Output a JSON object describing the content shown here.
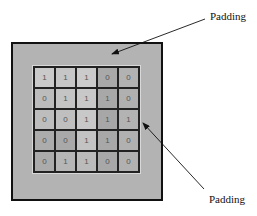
{
  "diagram": {
    "labels": {
      "top": "Padding",
      "bottom": "Padding"
    },
    "grid": {
      "rows": 5,
      "cols": 5,
      "values": [
        [
          "1",
          "1",
          "1",
          "0",
          "0"
        ],
        [
          "0",
          "1",
          "1",
          "1",
          "0"
        ],
        [
          "0",
          "0",
          "1",
          "1",
          "1"
        ],
        [
          "0",
          "0",
          "1",
          "1",
          "0"
        ],
        [
          "0",
          "1",
          "1",
          "0",
          "0"
        ]
      ],
      "shades": [
        [
          "#cacaca",
          "#c6c6c6",
          "#cbcbcb",
          "#a9a9a9",
          "#b2b2b2"
        ],
        [
          "#bcbcbc",
          "#c4c4c4",
          "#c8c8c8",
          "#a8a8a8",
          "#b0b0b0"
        ],
        [
          "#bdbdbd",
          "#bfbfbf",
          "#c8c8c8",
          "#a7a7a7",
          "#b3b3b3"
        ],
        [
          "#acacac",
          "#a9a9a9",
          "#c3c3c3",
          "#a8a8a8",
          "#b1b1b1"
        ],
        [
          "#ababab",
          "#b6b6b6",
          "#bbbbbb",
          "#a8a8a8",
          "#b1b1b1"
        ]
      ]
    },
    "colors": {
      "padding_fill": "#b3b3b3",
      "frame_border": "#111111",
      "grid_line": "#222222",
      "text": "#111111"
    }
  }
}
